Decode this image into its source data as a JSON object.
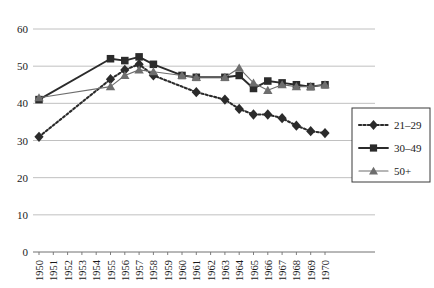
{
  "chart_data": {
    "type": "line",
    "title": "",
    "xlabel": "",
    "ylabel": "",
    "ylim": [
      0,
      60
    ],
    "ytick_values": [
      0,
      10,
      20,
      30,
      40,
      50,
      60
    ],
    "ytick_labels": [
      "0",
      "10",
      "20",
      "30",
      "40",
      "50",
      "60"
    ],
    "grid": true,
    "legend_position": "right",
    "categories": [
      "1950",
      "1951",
      "1952",
      "1953",
      "1954",
      "1955",
      "1956",
      "1957",
      "1958",
      "1959",
      "1960",
      "1961",
      "1962",
      "1963",
      "1964",
      "1965",
      "1966",
      "1967",
      "1968",
      "1969",
      "1970"
    ],
    "x": [
      1950,
      1951,
      1952,
      1953,
      1954,
      1955,
      1956,
      1957,
      1958,
      1959,
      1960,
      1961,
      1962,
      1963,
      1964,
      1965,
      1966,
      1967,
      1968,
      1969,
      1970
    ],
    "series": [
      {
        "name": "21–29",
        "marker": "diamond",
        "line_style": "dotted",
        "color": "#2b2b2b",
        "x": [
          1950,
          1955,
          1956,
          1957,
          1958,
          1961,
          1963,
          1964,
          1965,
          1966,
          1967,
          1968,
          1969,
          1970
        ],
        "values": [
          31,
          46.5,
          49,
          50.5,
          47.5,
          43,
          41,
          38.5,
          37,
          37,
          36,
          34,
          32.5,
          32
        ]
      },
      {
        "name": "30–49",
        "marker": "square",
        "line_style": "solid",
        "color": "#2b2b2b",
        "x": [
          1950,
          1955,
          1956,
          1957,
          1958,
          1960,
          1961,
          1963,
          1964,
          1965,
          1966,
          1967,
          1968,
          1969,
          1970
        ],
        "values": [
          41,
          52,
          51.5,
          52.5,
          50.5,
          47.5,
          47,
          47,
          47.5,
          44,
          46,
          45.5,
          45,
          44.5,
          45
        ]
      },
      {
        "name": "50+",
        "marker": "triangle",
        "line_style": "solid-thin",
        "color": "#6e6e6e",
        "x": [
          1950,
          1955,
          1956,
          1957,
          1958,
          1960,
          1961,
          1963,
          1964,
          1965,
          1966,
          1967,
          1968,
          1969,
          1970
        ],
        "values": [
          41.5,
          44.5,
          47.5,
          49,
          48.5,
          47.5,
          47,
          47,
          49.5,
          45.5,
          43.5,
          45,
          44.5,
          44.5,
          45
        ]
      }
    ],
    "legend": [
      {
        "label": "21–29",
        "marker": "diamond",
        "line_style": "dotted"
      },
      {
        "label": "30–49",
        "marker": "square",
        "line_style": "solid"
      },
      {
        "label": "50+",
        "marker": "triangle",
        "line_style": "solid-thin"
      }
    ]
  },
  "colors": {
    "grid": "#b9b9b9",
    "axis": "#707070",
    "dark": "#2b2b2b",
    "gray": "#6e6e6e",
    "legend_border": "#3a3a3a",
    "background": "#ffffff"
  }
}
